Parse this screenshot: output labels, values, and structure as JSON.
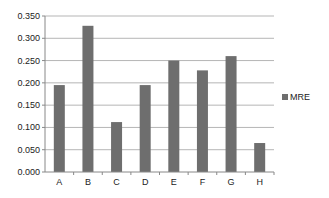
{
  "chart_data": {
    "type": "bar",
    "title": "",
    "xlabel": "",
    "ylabel": "",
    "categories": [
      "A",
      "B",
      "C",
      "D",
      "E",
      "F",
      "G",
      "H"
    ],
    "series": [
      {
        "name": "MRE",
        "values": [
          0.195,
          0.328,
          0.112,
          0.195,
          0.25,
          0.228,
          0.26,
          0.065
        ],
        "color": "#6e6e6e"
      }
    ],
    "ylim": [
      0,
      0.35
    ],
    "yticks": [
      "0.000",
      "0.050",
      "0.100",
      "0.150",
      "0.200",
      "0.250",
      "0.300",
      "0.350"
    ],
    "grid": true,
    "legend_position": "right"
  },
  "legend": {
    "label": "MRE"
  }
}
